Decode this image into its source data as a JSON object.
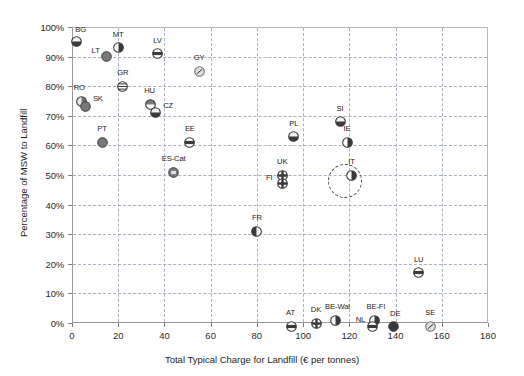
{
  "chart_data": {
    "type": "scatter",
    "title": "",
    "xlabel": "Total Typical Charge for Landfill (€ per tonnes)",
    "ylabel": "Percentage of MSW to Landfill",
    "xlim": [
      0,
      180
    ],
    "ylim": [
      0,
      100
    ],
    "xticks": [
      0,
      20,
      40,
      60,
      80,
      100,
      120,
      140,
      160,
      180
    ],
    "yticks": [
      "0%",
      "10%",
      "20%",
      "30%",
      "40%",
      "50%",
      "60%",
      "70%",
      "80%",
      "90%",
      "100%"
    ],
    "ytick_values": [
      0,
      10,
      20,
      30,
      40,
      50,
      60,
      70,
      80,
      90,
      100
    ],
    "grid": "dashed-both-axes",
    "legend": "none",
    "annotation": "dashed highlight circle around IT point",
    "points": [
      {
        "label": "BG",
        "x": 2,
        "y": 96,
        "label_dx": 4,
        "label_dy": -10,
        "style": "half-bottom-dark"
      },
      {
        "label": "MT",
        "x": 20,
        "y": 94,
        "label_dx": 0,
        "label_dy": -11,
        "style": "half-right-dark"
      },
      {
        "label": "LT",
        "x": 15,
        "y": 91,
        "label_dx": -11,
        "label_dy": -4,
        "style": "solid-grey"
      },
      {
        "label": "LV",
        "x": 37,
        "y": 92,
        "label_dx": 0,
        "label_dy": -11,
        "style": "band-dark"
      },
      {
        "label": "GY",
        "x": 55,
        "y": 86,
        "label_dx": 0,
        "label_dy": -11,
        "style": "light-slash"
      },
      {
        "label": "GR",
        "x": 22,
        "y": 81,
        "label_dx": 0,
        "label_dy": -11,
        "style": "striped"
      },
      {
        "label": "RO",
        "x": 4,
        "y": 76,
        "label_dx": -2,
        "label_dy": -11,
        "style": "half-left-light"
      },
      {
        "label": "SK",
        "x": 6,
        "y": 74,
        "label_dx": 12,
        "label_dy": -6,
        "style": "solid-grey"
      },
      {
        "label": "HU",
        "x": 34,
        "y": 75,
        "label_dx": -1,
        "label_dy": -11,
        "style": "half-top-grey"
      },
      {
        "label": "CZ",
        "x": 36,
        "y": 72,
        "label_dx": 13,
        "label_dy": -5,
        "style": "half-bottom-dark"
      },
      {
        "label": "PT",
        "x": 13,
        "y": 62,
        "label_dx": 0,
        "label_dy": -11,
        "style": "solid-grey"
      },
      {
        "label": "EE",
        "x": 51,
        "y": 62,
        "label_dx": 0,
        "label_dy": -11,
        "style": "band-dark"
      },
      {
        "label": "ES-Cat",
        "x": 44,
        "y": 52,
        "label_dx": 0,
        "label_dy": -11,
        "style": "boxed-grey"
      },
      {
        "label": "PL",
        "x": 96,
        "y": 64,
        "label_dx": 0,
        "label_dy": -11,
        "style": "half-bottom-dark"
      },
      {
        "label": "SI",
        "x": 116,
        "y": 69,
        "label_dx": 0,
        "label_dy": -11,
        "style": "half-bottom-dark"
      },
      {
        "label": "IE",
        "x": 119,
        "y": 62,
        "label_dx": 0,
        "label_dy": -11,
        "style": "half-right-dark"
      },
      {
        "label": "UK",
        "x": 91,
        "y": 51,
        "label_dx": 0,
        "label_dy": -11,
        "style": "cross-dark"
      },
      {
        "label": "FI",
        "x": 91,
        "y": 48,
        "label_dx": -13,
        "label_dy": -4,
        "style": "cross-dark"
      },
      {
        "label": "IT",
        "x": 121,
        "y": 51,
        "label_dx": 0,
        "label_dy": -11,
        "style": "half-right-dark"
      },
      {
        "label": "FR",
        "x": 80,
        "y": 32,
        "label_dx": 0,
        "label_dy": -11,
        "style": "half-left-dark"
      },
      {
        "label": "LU",
        "x": 150,
        "y": 18,
        "label_dx": 0,
        "label_dy": -11,
        "style": "band-dark"
      },
      {
        "label": "AT",
        "x": 95,
        "y": 0,
        "label_dx": -1,
        "label_dy": -11,
        "style": "band-dark"
      },
      {
        "label": "DK",
        "x": 106,
        "y": 1,
        "label_dx": -1,
        "label_dy": -11,
        "style": "cross-dark"
      },
      {
        "label": "BE-Wal",
        "x": 114,
        "y": 2,
        "label_dx": 2,
        "label_dy": -11,
        "style": "half-right-dark"
      },
      {
        "label": "BE-Fl",
        "x": 131,
        "y": 2,
        "label_dx": 1,
        "label_dy": -11,
        "style": "half-right-dark"
      },
      {
        "label": "NL",
        "x": 130,
        "y": 0,
        "label_dx": -12,
        "label_dy": -4,
        "style": "band-dark"
      },
      {
        "label": "DE",
        "x": 139,
        "y": 0,
        "label_dx": 2,
        "label_dy": -10,
        "style": "solid-dark"
      },
      {
        "label": "SE",
        "x": 155,
        "y": 0,
        "label_dx": 0,
        "label_dy": -11,
        "style": "light-slash"
      }
    ],
    "highlight": {
      "x": 118,
      "y": 48,
      "radius_px": 17
    }
  },
  "colors": {
    "grid": "#9aa4b5",
    "axis": "#9a9a9a",
    "marker_dark": "#3a3a3a",
    "marker_grey": "#787878",
    "marker_light": "#d8d8d8",
    "text": "#1d1d1d"
  }
}
